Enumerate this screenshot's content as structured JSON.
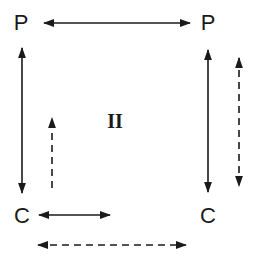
{
  "diagram": {
    "nodes": [
      {
        "id": "p-top-left",
        "label": "P",
        "x": 21,
        "y": 23
      },
      {
        "id": "p-top-right",
        "label": "P",
        "x": 208,
        "y": 23
      },
      {
        "id": "c-bottom-left",
        "label": "C",
        "x": 22,
        "y": 216
      },
      {
        "id": "c-bottom-right",
        "label": "C",
        "x": 208,
        "y": 216
      }
    ],
    "center_label": {
      "text": "II",
      "x": 115,
      "y": 121
    },
    "edges": [
      {
        "id": "p-p-solid",
        "style": "solid",
        "direction": "both",
        "from": [
          44,
          23
        ],
        "to": [
          190,
          23
        ]
      },
      {
        "id": "left-p-c-solid",
        "style": "solid",
        "direction": "both",
        "from": [
          22,
          48
        ],
        "to": [
          22,
          193
        ]
      },
      {
        "id": "left-c-up-dashed",
        "style": "dashed",
        "direction": "up",
        "from": [
          52,
          188
        ],
        "to": [
          52,
          118
        ]
      },
      {
        "id": "right-p-c-solid",
        "style": "solid",
        "direction": "both",
        "from": [
          208,
          50
        ],
        "to": [
          208,
          192
        ]
      },
      {
        "id": "right-dashed",
        "style": "dashed",
        "direction": "both",
        "from": [
          239,
          58
        ],
        "to": [
          239,
          186
        ]
      },
      {
        "id": "c-solid-short",
        "style": "solid",
        "direction": "both",
        "from": [
          39,
          215
        ],
        "to": [
          110,
          215
        ]
      },
      {
        "id": "c-c-dashed",
        "style": "dashed",
        "direction": "both",
        "from": [
          38,
          245
        ],
        "to": [
          186,
          245
        ]
      }
    ]
  }
}
